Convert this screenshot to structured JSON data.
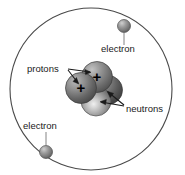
{
  "diagram": {
    "background_color": "#ffffff",
    "orbit": {
      "name": "electron-orbit-path",
      "center_x": 91,
      "center_y": 89,
      "radius": 81,
      "stroke_color": "#4a4a4a",
      "stroke_width": 1.1
    },
    "labels": {
      "protons": "protons",
      "neutrons": "neutrons",
      "electron_top": "electron",
      "electron_bottom": "electron",
      "proton_charge_symbol": "+"
    },
    "particles": {
      "protons": [
        {
          "name": "proton-left",
          "cx": 81,
          "cy": 87,
          "r": 15.5,
          "charge": "+",
          "fill": "#6d6d6d"
        },
        {
          "name": "proton-upper-right",
          "cx": 97,
          "cy": 77,
          "r": 15.5,
          "charge": "+",
          "fill": "#7a7a7a"
        }
      ],
      "neutrons": [
        {
          "name": "neutron-right",
          "cx": 108,
          "cy": 90,
          "r": 14.5,
          "fill": "#5d5d5d"
        },
        {
          "name": "neutron-bottom",
          "cx": 96,
          "cy": 100,
          "r": 15.0,
          "fill": "#8a8a8a"
        }
      ],
      "electrons": [
        {
          "name": "electron-top-right",
          "cx": 124,
          "cy": 26,
          "r": 6.5,
          "fill": "#8d8d8d"
        },
        {
          "name": "electron-bottom-left",
          "cx": 46,
          "cy": 152,
          "r": 6.5,
          "fill": "#8d8d8d"
        }
      ]
    },
    "leader_lines": {
      "protons_to_left_proton": {
        "x1": 70,
        "y1": 70,
        "x2": 79,
        "y2": 84
      },
      "protons_to_upper_proton": {
        "x1": 70,
        "y1": 69,
        "x2": 92,
        "y2": 73
      },
      "neutrons_to_right_neutron": {
        "x1": 122,
        "y1": 104,
        "x2": 106,
        "y2": 91
      },
      "neutrons_to_bottom_neutron": {
        "x1": 122,
        "y1": 105,
        "x2": 100,
        "y2": 101
      },
      "electron_top_leader": {
        "x1": 124,
        "y1": 33,
        "x2": 124,
        "y2": 45
      },
      "electron_bottom_leader": {
        "x1": 46,
        "y1": 132,
        "x2": 46,
        "y2": 145
      }
    },
    "label_positions": {
      "protons": {
        "x": 27,
        "y": 70
      },
      "neutrons": {
        "x": 126,
        "y": 110
      },
      "electron_top": {
        "x": 101,
        "y": 56
      },
      "electron_bottom": {
        "x": 23,
        "y": 129
      }
    }
  }
}
